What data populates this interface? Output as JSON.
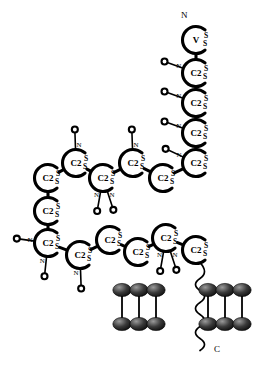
{
  "diagram": {
    "terminus_n_label": "N",
    "terminus_c_label": "C",
    "residue_label_default": "C2",
    "sulfate_mark": "S",
    "amide_mark": "N",
    "colors": {
      "stroke": "#000000",
      "fill": "#ffffff",
      "lipid_head": "#2b2b2b",
      "background": "#ffffff"
    },
    "residues": [
      {
        "id": "r1",
        "label": "V",
        "x": 196,
        "y": 40,
        "rot": 0,
        "s_count": 2,
        "branch": null
      },
      {
        "id": "r2",
        "label": "C2",
        "x": 196,
        "y": 73,
        "rot": 0,
        "s_count": 2,
        "branch": "left"
      },
      {
        "id": "r3",
        "label": "C2",
        "x": 196,
        "y": 103,
        "rot": 0,
        "s_count": 2,
        "branch": "left"
      },
      {
        "id": "r4",
        "label": "C2",
        "x": 196,
        "y": 133,
        "rot": 0,
        "s_count": 2,
        "branch": "left"
      },
      {
        "id": "r5",
        "label": "C2",
        "x": 196,
        "y": 163,
        "rot": 0,
        "s_count": 2,
        "branch": "upleft"
      },
      {
        "id": "r6",
        "label": "C2",
        "x": 163,
        "y": 178,
        "rot": 0,
        "s_count": 2,
        "branch": null
      },
      {
        "id": "r7",
        "label": "C2",
        "x": 133,
        "y": 163,
        "rot": 0,
        "s_count": 2,
        "branch": "up"
      },
      {
        "id": "r8",
        "label": "C2",
        "x": 103,
        "y": 178,
        "rot": 0,
        "s_count": 2,
        "branch": "downx2"
      },
      {
        "id": "r9",
        "label": "C2",
        "x": 76,
        "y": 163,
        "rot": 0,
        "s_count": 2,
        "branch": "up"
      },
      {
        "id": "r10",
        "label": "C2",
        "x": 48,
        "y": 178,
        "rot": 0,
        "s_count": 2,
        "branch": null
      },
      {
        "id": "r11",
        "label": "C2",
        "x": 48,
        "y": 211,
        "rot": 0,
        "s_count": 2,
        "branch": null
      },
      {
        "id": "r12",
        "label": "C2",
        "x": 48,
        "y": 243,
        "rot": 0,
        "s_count": 2,
        "branch": "leftdown"
      },
      {
        "id": "r13",
        "label": "C2",
        "x": 80,
        "y": 255,
        "rot": 0,
        "s_count": 2,
        "branch": "down"
      },
      {
        "id": "r14",
        "label": "C2",
        "x": 110,
        "y": 240,
        "rot": 0,
        "s_count": 2,
        "branch": null
      },
      {
        "id": "r15",
        "label": "C2",
        "x": 138,
        "y": 252,
        "rot": 0,
        "s_count": 2,
        "branch": null
      },
      {
        "id": "r16",
        "label": "C2",
        "x": 166,
        "y": 238,
        "rot": 0,
        "s_count": 2,
        "branch": "downx2"
      },
      {
        "id": "r17",
        "label": "C2",
        "x": 196,
        "y": 250,
        "rot": 0,
        "s_count": 2,
        "branch": null
      }
    ],
    "lipid_bilayer": {
      "left_cluster": {
        "x": 122,
        "y": 290,
        "heads_per_row": 3,
        "rows": 2
      },
      "right_cluster": {
        "x": 208,
        "y": 290,
        "heads_per_row": 3,
        "rows": 2
      }
    }
  }
}
